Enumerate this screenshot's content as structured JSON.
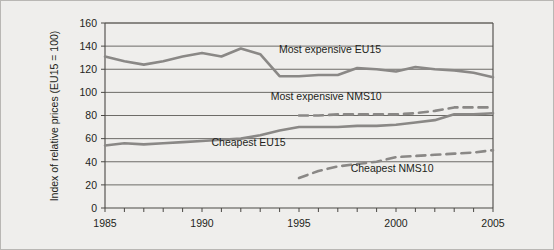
{
  "figure": {
    "background": "#efeeec",
    "border_color": "#b9b7b4",
    "line_color": "#8a8886",
    "text_color": "#231f20"
  },
  "axis": {
    "y_title": "Index of relative prices (EU15 = 100)",
    "y_ticks": [
      "0",
      "20",
      "40",
      "60",
      "80",
      "100",
      "120",
      "140",
      "160"
    ],
    "x_ticks_labeled": [
      "1985",
      "1990",
      "1995",
      "2000",
      "2005"
    ]
  },
  "labels": {
    "most_expensive_eu15": "Most expensive EU15",
    "most_expensive_nms10": "Most expensive NMS10",
    "cheapest_eu15": "Cheapest EU15",
    "cheapest_nms10": "Cheapest NMS10"
  },
  "chart_data": {
    "type": "line",
    "title": "",
    "xlabel": "",
    "ylabel": "Index of relative prices (EU15 = 100)",
    "xlim": [
      1985,
      2005
    ],
    "ylim": [
      0,
      160
    ],
    "y_ticks": [
      0,
      20,
      40,
      60,
      80,
      100,
      120,
      140,
      160
    ],
    "x_ticks": [
      1985,
      1986,
      1987,
      1988,
      1989,
      1990,
      1991,
      1992,
      1993,
      1994,
      1995,
      1996,
      1997,
      1998,
      1999,
      2000,
      2001,
      2002,
      2003,
      2004,
      2005
    ],
    "x_tick_labels": [
      "1985",
      "",
      "",
      "",
      "",
      "1990",
      "",
      "",
      "",
      "",
      "1995",
      "",
      "",
      "",
      "",
      "2000",
      "",
      "",
      "",
      "",
      "2005"
    ],
    "grid": "horizontal",
    "legend": "inline-annotations",
    "series": [
      {
        "name": "Most expensive EU15",
        "style": "solid",
        "x": [
          1985,
          1986,
          1987,
          1988,
          1989,
          1990,
          1991,
          1992,
          1993,
          1994,
          1995,
          1996,
          1997,
          1998,
          1999,
          2000,
          2001,
          2002,
          2003,
          2004,
          2005
        ],
        "values": [
          131,
          127,
          124,
          127,
          131,
          134,
          131,
          138,
          133,
          114,
          114,
          115,
          115,
          121,
          120,
          118,
          122,
          120,
          119,
          117,
          113
        ]
      },
      {
        "name": "Most expensive NMS10",
        "style": "dashed",
        "x": [
          1995,
          1996,
          1997,
          1998,
          1999,
          2000,
          2001,
          2002,
          2003,
          2004,
          2005
        ],
        "values": [
          80,
          80,
          81,
          81,
          81,
          81,
          82,
          84,
          87,
          87,
          87
        ]
      },
      {
        "name": "Cheapest EU15",
        "style": "solid",
        "x": [
          1985,
          1986,
          1987,
          1988,
          1989,
          1990,
          1991,
          1992,
          1993,
          1994,
          1995,
          1996,
          1997,
          1998,
          1999,
          2000,
          2001,
          2002,
          2003,
          2004,
          2005
        ],
        "values": [
          54,
          56,
          55,
          56,
          57,
          58,
          59,
          60,
          63,
          67,
          70,
          70,
          70,
          71,
          71,
          72,
          74,
          76,
          81,
          81,
          82
        ]
      },
      {
        "name": "Cheapest NMS10",
        "style": "dashed",
        "x": [
          1995,
          1996,
          1997,
          1998,
          1999,
          2000,
          2001,
          2002,
          2003,
          2004,
          2005
        ],
        "values": [
          26,
          32,
          36,
          38,
          40,
          44,
          45,
          46,
          47,
          48,
          50
        ]
      }
    ],
    "annotations": [
      {
        "text": "Most expensive EU15",
        "x": 1996.6,
        "y": 134
      },
      {
        "text": "Most expensive NMS10",
        "x": 1996.4,
        "y": 93
      },
      {
        "text": "Cheapest EU15",
        "x": 1992.4,
        "y": 54
      },
      {
        "text": "Cheapest NMS10",
        "x": 1999.8,
        "y": 31
      }
    ]
  }
}
